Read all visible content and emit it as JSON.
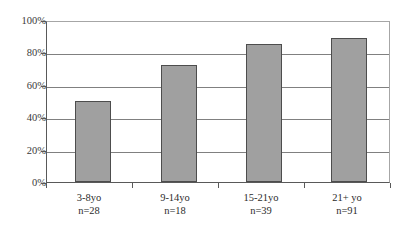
{
  "chart_data": {
    "type": "bar",
    "title": "",
    "subtitle": "",
    "xlabel": "",
    "ylabel": "",
    "categories": [
      "3-8yo",
      "9-14yo",
      "15-21yo",
      "21+ yo"
    ],
    "category_sublabels": [
      "n=28",
      "n=18",
      "n=39",
      "n=91"
    ],
    "values": [
      50,
      72,
      85,
      89
    ],
    "ylim": [
      0,
      100
    ],
    "ytick_values": [
      0,
      20,
      40,
      60,
      80,
      100
    ],
    "ytick_labels": [
      "0%",
      "20%",
      "40%",
      "60%",
      "80%",
      "100%"
    ],
    "grid": true,
    "grid_axis": "y",
    "legend": false,
    "legend_position": "none",
    "series": [
      {
        "name": "",
        "values": [
          50,
          72,
          85,
          89
        ]
      }
    ],
    "colors": {
      "bar_fill": "#a0a0a0",
      "bar_border": "#4d4d4d",
      "gridline": "#808080",
      "axis": "#595959",
      "plot_border": "#a6a6a6",
      "background": "#ffffff",
      "text": "#2b2b2b"
    }
  }
}
